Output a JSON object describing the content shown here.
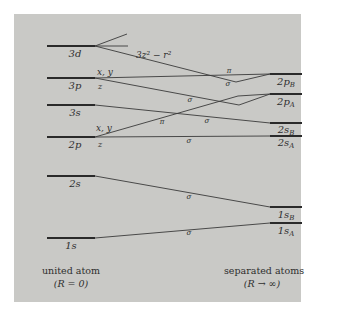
{
  "figure": {
    "type": "correlation diagram"
  },
  "united_atom": {
    "caption_line1": "united atom",
    "caption_line2": "(R = 0)",
    "levels": [
      {
        "label": "3d",
        "y": 46
      },
      {
        "label": "3p",
        "y": 78
      },
      {
        "label": "3s",
        "y": 105
      },
      {
        "label": "2p",
        "y": 137
      },
      {
        "label": "2s",
        "y": 176
      },
      {
        "label": "1s",
        "y": 238
      }
    ]
  },
  "separated_atoms": {
    "caption_line1": "separated atoms",
    "caption_line2": "(R → ∞)",
    "levels": [
      {
        "label": "2p",
        "sub": "B",
        "y": 74
      },
      {
        "label": "2p",
        "sub": "A",
        "y": 94
      },
      {
        "label": "2s",
        "sub": "B",
        "y": 123
      },
      {
        "label": "2s",
        "sub": "A",
        "y": 136
      },
      {
        "label": "1s",
        "sub": "B",
        "y": 207
      },
      {
        "label": "1s",
        "sub": "A",
        "y": 223
      }
    ]
  },
  "component_labels": {
    "d_component": "3z² − r²",
    "p3_xy": "x, y",
    "p3_z": "z",
    "p2_xy": "x, y",
    "p2_z": "z"
  },
  "symmetry_labels": {
    "pi_3p": "π",
    "sigma_3d": "σ",
    "sigma_3p_z": "σ",
    "pi_2p": "π",
    "sigma_3s": "σ",
    "sigma_2p_z": "σ",
    "sigma_2s": "σ",
    "sigma_1s": "σ"
  },
  "colors": {
    "background": "#ffffff",
    "panel": "#c9c9c6",
    "line": "#3a3a3a",
    "text": "#2e2e2e"
  }
}
